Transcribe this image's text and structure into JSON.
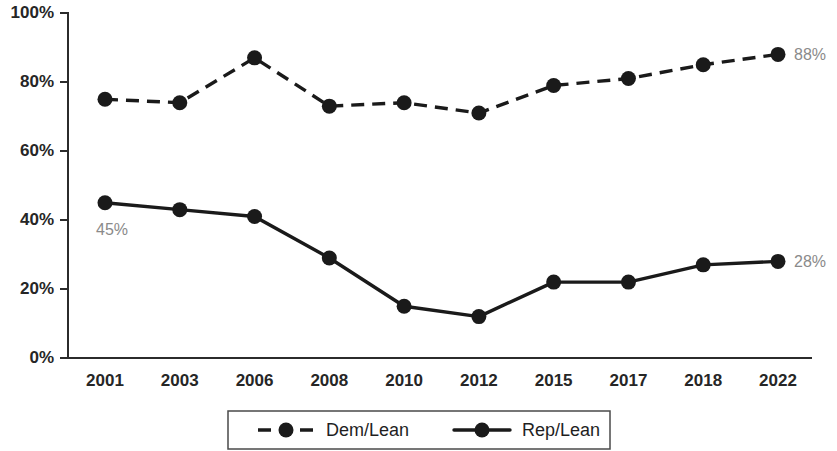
{
  "chart_data": {
    "type": "line",
    "title": "",
    "subtitle": "",
    "xlabel": "",
    "ylabel": "",
    "ylim": [
      0,
      100
    ],
    "yticks": [
      "0%",
      "20%",
      "40%",
      "60%",
      "80%",
      "100%"
    ],
    "ytick_values": [
      0,
      20,
      40,
      60,
      80,
      100
    ],
    "grid": false,
    "legend_position": "bottom",
    "categories": [
      "2001",
      "2003",
      "2006",
      "2008",
      "2010",
      "2012",
      "2015",
      "2017",
      "2018",
      "2022"
    ],
    "series": [
      {
        "name": "Dem/Lean",
        "style": "dashed",
        "values": [
          75,
          74,
          87,
          73,
          74,
          71,
          79,
          81,
          85,
          88
        ]
      },
      {
        "name": "Rep/Lean",
        "style": "solid",
        "values": [
          45,
          43,
          41,
          29,
          15,
          12,
          22,
          22,
          27,
          28
        ]
      }
    ],
    "annotations": [
      {
        "text": "88%",
        "series": "Dem/Lean",
        "category": "2022",
        "position": "right"
      },
      {
        "text": "28%",
        "series": "Rep/Lean",
        "category": "2022",
        "position": "right"
      },
      {
        "text": "45%",
        "series": "Rep/Lean",
        "category": "2001",
        "position": "below"
      }
    ],
    "colors": {
      "dem_lean": "#1a1a1a",
      "rep_lean": "#1a1a1a",
      "axis": "#2b2b2b",
      "annotation": "#8a8a8a",
      "background": "#ffffff"
    }
  },
  "legend": {
    "items": [
      {
        "label": "Dem/Lean",
        "style": "dashed"
      },
      {
        "label": "Rep/Lean",
        "style": "solid"
      }
    ]
  }
}
